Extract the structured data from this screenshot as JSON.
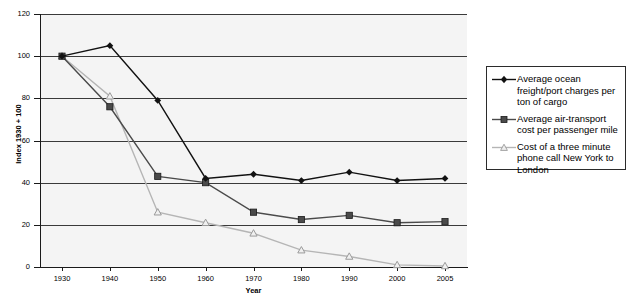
{
  "chart_data": {
    "type": "line",
    "title": "",
    "xlabel": "Year",
    "ylabel": "Index 1930 + 100",
    "categories": [
      "1930",
      "1940",
      "1950",
      "1960",
      "1970",
      "1980",
      "1990",
      "2000",
      "2005"
    ],
    "ylim": [
      0,
      120
    ],
    "yticks": [
      0,
      20,
      40,
      60,
      80,
      100,
      120
    ],
    "grid": true,
    "legend_position": "right",
    "series": [
      {
        "name": "Average ocean freight/port charges per ton of cargo",
        "marker": "diamond",
        "color": "#111111",
        "values": [
          100,
          105,
          79,
          42,
          44,
          41,
          45,
          41,
          42
        ]
      },
      {
        "name": "Average air-transport cost per passenger mile",
        "marker": "square",
        "color": "#4a4a4a",
        "values": [
          100,
          76,
          43,
          40,
          26,
          22.5,
          24.5,
          21,
          21.5
        ]
      },
      {
        "name": "Cost of a three minute phone call New York to London",
        "marker": "triangle",
        "color": "#b5b5b5",
        "values": [
          100,
          81,
          26,
          21,
          16,
          8,
          5,
          1,
          0.5
        ]
      }
    ]
  },
  "axes": {
    "y_title": "Index 1930 + 100",
    "x_title": "Year",
    "y_tick_labels": [
      "0",
      "20",
      "40",
      "60",
      "80",
      "100",
      "120"
    ],
    "x_tick_labels": [
      "1930",
      "1940",
      "1950",
      "1960",
      "1970",
      "1980",
      "1990",
      "2000",
      "2005"
    ]
  },
  "legend": {
    "items": [
      {
        "label": "Average ocean freight/port charges per ton of cargo",
        "marker": "diamond-marker",
        "color": "#111111"
      },
      {
        "label": "Average air-transport cost per passenger mile",
        "marker": "square-marker",
        "color": "#4a4a4a"
      },
      {
        "label": "Cost of a three minute phone call New York to London",
        "marker": "triangle-marker",
        "color": "#b5b5b5"
      }
    ]
  }
}
